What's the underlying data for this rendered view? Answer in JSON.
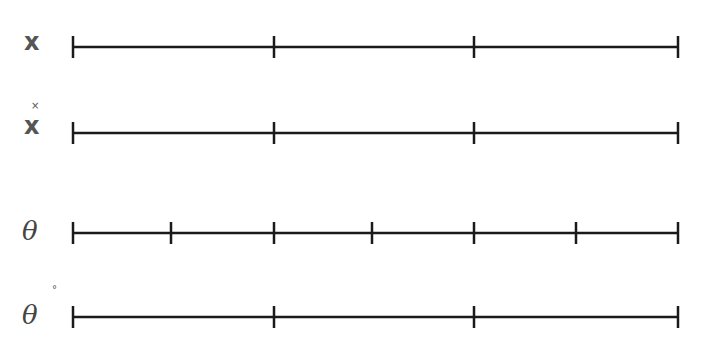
{
  "diagram": {
    "rows": [
      {
        "label": "x",
        "accent": "",
        "y": 47,
        "ticks": [
          73,
          274,
          474,
          678
        ]
      },
      {
        "label": "x",
        "accent": "˙",
        "y": 133,
        "ticks": [
          73,
          274,
          474,
          678
        ]
      },
      {
        "label": "θ",
        "accent": "",
        "y": 233,
        "ticks": [
          73,
          171,
          274,
          372,
          474,
          576,
          678
        ]
      },
      {
        "label": "θ",
        "accent": "˚",
        "y": 317,
        "ticks": [
          73,
          274,
          474,
          678
        ]
      }
    ],
    "line_color": "#1a1a1a"
  }
}
